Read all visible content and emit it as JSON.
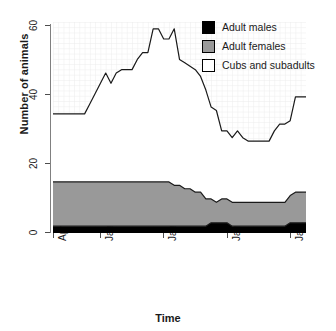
{
  "chart_data": {
    "type": "area",
    "title": "",
    "xlabel": "Time",
    "ylabel": "Number of animals",
    "ylim": [
      0,
      62
    ],
    "yticks": [
      0,
      20,
      40,
      60
    ],
    "ytick_labels": [
      "0",
      "20",
      "40",
      "60"
    ],
    "xtick_labels": [
      "April 1999",
      "January 2000",
      "January 2001",
      "January 2002",
      "January 2003"
    ],
    "xtick_positions": [
      0,
      9,
      21,
      33,
      45
    ],
    "xlim": [
      0,
      48
    ],
    "grid": true,
    "stacked": true,
    "legend_position": "top-right",
    "legend": [
      "Adult males",
      "Adult females",
      "Cubs and subadults"
    ],
    "colors": {
      "adult_males": "#000000",
      "adult_females": "#999999",
      "cubs_and_subadults": "#ffffff",
      "line": "#1a1a1a",
      "grid": "#e8e8e8",
      "axis": "#808080"
    },
    "x": [
      0,
      1,
      2,
      3,
      4,
      5,
      6,
      7,
      8,
      9,
      10,
      11,
      12,
      13,
      14,
      15,
      16,
      17,
      18,
      19,
      20,
      21,
      22,
      23,
      24,
      25,
      26,
      27,
      28,
      29,
      30,
      31,
      32,
      33,
      34,
      35,
      36,
      37,
      38,
      39,
      40,
      41,
      42,
      43,
      44,
      45,
      46,
      47,
      48
    ],
    "series": [
      {
        "name": "Adult males",
        "values": [
          2,
          2,
          2,
          2,
          2,
          2,
          2,
          2,
          2,
          2,
          2,
          2,
          2,
          2,
          2,
          2,
          2,
          2,
          2,
          2,
          2,
          2,
          2,
          2,
          2,
          2,
          2,
          2,
          2,
          2,
          3,
          3,
          3,
          3,
          2,
          2,
          2,
          2,
          2,
          2,
          2,
          2,
          2,
          2,
          2,
          3,
          3,
          3,
          3
        ]
      },
      {
        "name": "Adult females",
        "values": [
          13,
          13,
          13,
          13,
          13,
          13,
          13,
          13,
          13,
          13,
          13,
          13,
          13,
          13,
          13,
          13,
          13,
          13,
          13,
          13,
          13,
          13,
          13,
          12,
          12,
          11,
          11,
          10,
          10,
          8,
          7,
          6,
          7,
          7,
          7,
          7,
          7,
          7,
          7,
          7,
          7,
          7,
          7,
          7,
          7,
          8,
          9,
          9,
          9
        ]
      },
      {
        "name": "Cubs and subadults",
        "values": [
          20,
          20,
          20,
          20,
          20,
          20,
          20,
          23,
          26,
          29,
          32,
          29,
          32,
          33,
          33,
          33,
          36,
          38,
          38,
          45,
          45,
          42,
          42,
          46,
          37,
          37,
          36,
          36,
          34,
          32,
          27,
          27,
          20,
          20,
          19,
          21,
          19,
          18,
          18,
          18,
          18,
          18,
          21,
          23,
          23,
          22,
          28,
          28,
          28
        ]
      }
    ],
    "total": [
      35,
      35,
      35,
      35,
      35,
      35,
      35,
      38,
      41,
      44,
      47,
      44,
      47,
      48,
      48,
      48,
      51,
      53,
      53,
      60,
      60,
      57,
      57,
      60,
      51,
      50,
      49,
      48,
      46,
      42,
      37,
      36,
      30,
      30,
      28,
      30,
      28,
      27,
      27,
      27,
      27,
      27,
      30,
      32,
      32,
      33,
      40,
      40,
      40
    ]
  }
}
